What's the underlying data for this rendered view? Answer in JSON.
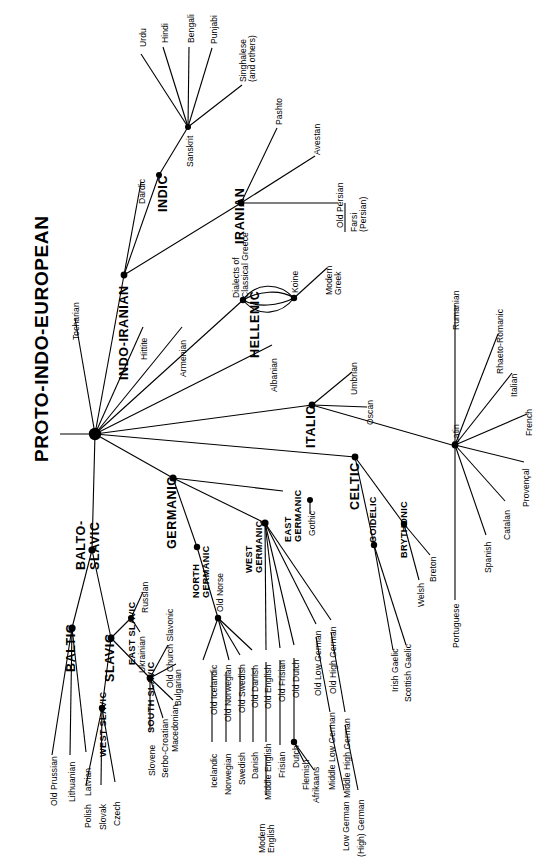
{
  "diagram": {
    "title": "PROTO-INDO-EUROPEAN",
    "type": "language-family-tree",
    "ink_color": "#000000",
    "background_color": "#ffffff"
  },
  "branches": {
    "indo_iranian": "INDO-IRANIAN",
    "indic": "INDIC",
    "iranian": "IRANIAN",
    "hellenic": "HELLENIC",
    "italic": "ITALIC",
    "celtic": "CELTIC",
    "germanic": "GERMANIC",
    "balto_slavic": "BALTO-\nSLAVIC",
    "baltic": "BALTIC",
    "slavic": "SLAVIC",
    "east_slavic": "EAST SLAVIC",
    "west_slavic": "WEST SLAVIC",
    "south_slavic": "SOUTH SLAVIC",
    "north_germanic": "NORTH\nGERMANIC",
    "west_germanic": "WEST\nGERMANIC",
    "east_germanic": "EAST\nGERMANIC",
    "goidelic": "GOIDELIC",
    "brythonic": "BRYTHONIC"
  },
  "languages": {
    "tocharian": "Tocharian",
    "hittite": "Hittite",
    "armenian": "Armenian",
    "albanian": "Albanian",
    "dardic": "Dardic",
    "sanskrit": "Sanskrit",
    "urdu": "Urdu",
    "hindi": "Hindi",
    "bengali": "Bengali",
    "punjabi": "Punjabi",
    "singhalese": "Singhalese\n(and others)",
    "pashto": "Pashto",
    "avestan": "Avestan",
    "old_persian": "Old Persian",
    "farsi": "Farsi\n(Persian)",
    "dialects_classical_greece": "Dialects of\nClassical Greece",
    "koine": "Koine",
    "modern_greek": "Modern\nGreek",
    "umbrian": "Umbrian",
    "oscan": "Oscan",
    "latin": "Latin",
    "rumanian": "Rumanian",
    "rhaeto_romanic": "Rhaeto-Romanic",
    "italian": "Italian",
    "french": "French",
    "provencal": "Provençal",
    "catalan": "Catalan",
    "spanish": "Spanish",
    "portuguese": "Portuguese",
    "irish_gaelic": "Irish Gaelic",
    "scottish_gaelic": "Scottish Gaelic",
    "welsh": "Welsh",
    "breton": "Breton",
    "gothic": "Gothic",
    "old_norse": "Old Norse",
    "old_icelandic": "Old Icelandic",
    "icelandic": "Icelandic",
    "old_norwegian": "Old Norwegian",
    "norwegian": "Norwegian",
    "old_swedish": "Old Swedish",
    "swedish": "Swedish",
    "old_danish": "Old Danish",
    "danish": "Danish",
    "old_english": "Old English",
    "middle_english": "Middle English",
    "modern_english": "Modern\nEnglish",
    "old_frisian": "Old Frisian",
    "frisian": "Frisian",
    "old_dutch": "Old Dutch",
    "dutch": "Dutch",
    "flemish": "Flemish",
    "afrikaans": "Afrikaans",
    "old_low_german": "Old Low German",
    "middle_low_german": "Middle Low German",
    "low_german": "Low German",
    "old_high_german": "Old High German",
    "middle_high_german": "Middle High German",
    "high_german": "(High) German",
    "old_prussian": "Old Prussian",
    "lithuanian": "Lithuanian",
    "latvian": "Latvian",
    "russian": "Russian",
    "ukrainian": "Ukrainian",
    "polish": "Polish",
    "slovak": "Slovak",
    "czech": "Czech",
    "old_church_slavonic": "Old Church Slavonic",
    "bulgarian": "Bulgarian",
    "macedonian": "Macedonian",
    "serbo_croatian": "Serbo-Croatian",
    "slovene": "Slovene"
  }
}
